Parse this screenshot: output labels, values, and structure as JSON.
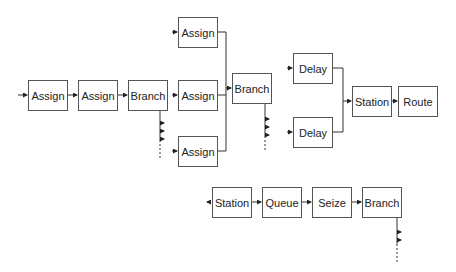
{
  "diagram": {
    "type": "simulation-flowchart",
    "blocks": [
      {
        "id": "assign1",
        "label": "Assign",
        "x": 28,
        "y": 80,
        "w": 40,
        "h": 31
      },
      {
        "id": "assign2",
        "label": "Assign",
        "x": 78,
        "y": 80,
        "w": 40,
        "h": 31
      },
      {
        "id": "branch1",
        "label": "Branch",
        "x": 128,
        "y": 80,
        "w": 40,
        "h": 31
      },
      {
        "id": "assign3",
        "label": "Assign",
        "x": 178,
        "y": 17,
        "w": 40,
        "h": 31
      },
      {
        "id": "assign4",
        "label": "Assign",
        "x": 178,
        "y": 80,
        "w": 40,
        "h": 31
      },
      {
        "id": "assign5",
        "label": "Assign",
        "x": 178,
        "y": 136,
        "w": 40,
        "h": 31
      },
      {
        "id": "branch2",
        "label": "Branch",
        "x": 232,
        "y": 73,
        "w": 40,
        "h": 31
      },
      {
        "id": "delay1",
        "label": "Delay",
        "x": 293,
        "y": 53,
        "w": 40,
        "h": 31
      },
      {
        "id": "delay2",
        "label": "Delay",
        "x": 293,
        "y": 117,
        "w": 40,
        "h": 31
      },
      {
        "id": "station1",
        "label": "Station",
        "x": 352,
        "y": 86,
        "w": 40,
        "h": 31
      },
      {
        "id": "route1",
        "label": "Route",
        "x": 398,
        "y": 86,
        "w": 40,
        "h": 31
      },
      {
        "id": "station2",
        "label": "Station",
        "x": 212,
        "y": 187,
        "w": 40,
        "h": 31
      },
      {
        "id": "queue1",
        "label": "Queue",
        "x": 262,
        "y": 187,
        "w": 40,
        "h": 31
      },
      {
        "id": "seize1",
        "label": "Seize",
        "x": 312,
        "y": 187,
        "w": 40,
        "h": 31
      },
      {
        "id": "branch3",
        "label": "Branch",
        "x": 362,
        "y": 187,
        "w": 40,
        "h": 31
      }
    ],
    "connections": [
      [
        "entry",
        "assign1"
      ],
      [
        "assign1",
        "assign2"
      ],
      [
        "assign2",
        "branch1"
      ],
      [
        "branch1",
        "assign4"
      ],
      [
        "branch1",
        "assign5"
      ],
      [
        "assign3",
        "branch2"
      ],
      [
        "assign4",
        "branch2"
      ],
      [
        "assign5",
        "branch2"
      ],
      [
        "delay1",
        "station1"
      ],
      [
        "delay2",
        "station1"
      ],
      [
        "station1",
        "route1"
      ],
      [
        "station2",
        "queue1"
      ],
      [
        "queue1",
        "seize1"
      ],
      [
        "seize1",
        "branch3"
      ]
    ]
  }
}
